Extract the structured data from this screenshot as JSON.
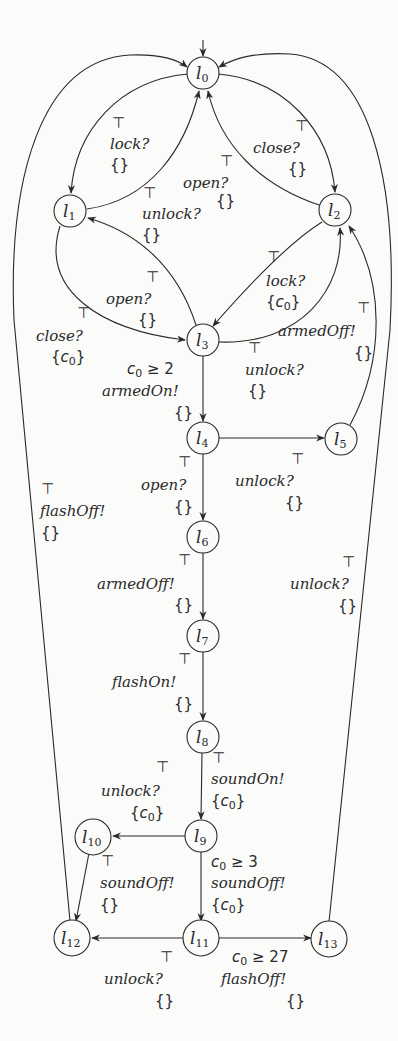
{
  "diagram": {
    "initial_location": "l0",
    "stroke_color": "#2a2a2a",
    "background_color": "#fbfbfa",
    "nodes": [
      {
        "id": "l0",
        "base": "l",
        "sub": "0",
        "x": 203,
        "y": 73
      },
      {
        "id": "l1",
        "base": "l",
        "sub": "1",
        "x": 70,
        "y": 211
      },
      {
        "id": "l2",
        "base": "l",
        "sub": "2",
        "x": 335,
        "y": 210
      },
      {
        "id": "l3",
        "base": "l",
        "sub": "3",
        "x": 203,
        "y": 340
      },
      {
        "id": "l4",
        "base": "l",
        "sub": "4",
        "x": 203,
        "y": 438
      },
      {
        "id": "l5",
        "base": "l",
        "sub": "5",
        "x": 341,
        "y": 439
      },
      {
        "id": "l6",
        "base": "l",
        "sub": "6",
        "x": 203,
        "y": 537
      },
      {
        "id": "l7",
        "base": "l",
        "sub": "7",
        "x": 203,
        "y": 636
      },
      {
        "id": "l8",
        "base": "l",
        "sub": "8",
        "x": 203,
        "y": 737
      },
      {
        "id": "l9",
        "base": "l",
        "sub": "9",
        "x": 201,
        "y": 836
      },
      {
        "id": "l10",
        "base": "l",
        "sub": "10",
        "x": 93,
        "y": 837
      },
      {
        "id": "l11",
        "base": "l",
        "sub": "11",
        "x": 201,
        "y": 938
      },
      {
        "id": "l12",
        "base": "l",
        "sub": "12",
        "x": 72,
        "y": 938
      },
      {
        "id": "l13",
        "base": "l",
        "sub": "13",
        "x": 329,
        "y": 939
      }
    ],
    "edges": [
      {
        "from": "l0",
        "to": "l1",
        "guard": "⊤",
        "action": "lock?",
        "reset": "{}",
        "label_x": 110,
        "label_y": 122
      },
      {
        "from": "l1",
        "to": "l0",
        "guard": "⊤",
        "action": "unlock?",
        "reset": "{}",
        "label_x": 142,
        "label_y": 195
      },
      {
        "from": "l0",
        "to": "l2",
        "guard": "⊤",
        "action": "close?",
        "reset": "{}",
        "label_x": 253,
        "label_y": 127
      },
      {
        "from": "l2",
        "to": "l0",
        "guard": "⊤",
        "action": "open?",
        "reset": "{}",
        "label_x": 183,
        "label_y": 160
      },
      {
        "from": "l1",
        "to": "l3",
        "guard": "⊤",
        "action": "close?",
        "reset": "{c0}",
        "label_x": 36,
        "label_y": 313
      },
      {
        "from": "l3",
        "to": "l1",
        "guard": "⊤",
        "action": "open?",
        "reset": "{}",
        "label_x": 106,
        "label_y": 277
      },
      {
        "from": "l2",
        "to": "l3",
        "guard": "⊤",
        "action": "lock?",
        "reset": "{c0}",
        "label_x": 266,
        "label_y": 255
      },
      {
        "from": "l3",
        "to": "l2",
        "guard": "⊤",
        "action": "unlock?",
        "reset": "{}",
        "label_x": 245,
        "label_y": 347
      },
      {
        "from": "l3",
        "to": "l4",
        "guard": "c0 ≥ 2",
        "action": "armedOn!",
        "reset": "{}",
        "label_x": 102,
        "label_y": 366
      },
      {
        "from": "l4",
        "to": "l5",
        "guard": "⊤",
        "action": "unlock?",
        "reset": "{}",
        "label_x": 235,
        "label_y": 458
      },
      {
        "from": "l5",
        "to": "l2",
        "guard": "⊤",
        "action": "armedOff!",
        "reset": "{}",
        "label_x": 278,
        "label_y": 306
      },
      {
        "from": "l4",
        "to": "l6",
        "guard": "⊤",
        "action": "open?",
        "reset": "{}",
        "label_x": 141,
        "label_y": 464
      },
      {
        "from": "l6",
        "to": "l7",
        "guard": "⊤",
        "action": "armedOff!",
        "reset": "{}",
        "label_x": 97,
        "label_y": 558
      },
      {
        "from": "l7",
        "to": "l8",
        "guard": "⊤",
        "action": "flashOn!",
        "reset": "{}",
        "label_x": 112,
        "label_y": 657
      },
      {
        "from": "l8",
        "to": "l9",
        "guard": "⊤",
        "action": "soundOn!",
        "reset": "{c0}",
        "label_x": 211,
        "label_y": 756
      },
      {
        "from": "l9",
        "to": "l10",
        "guard": "⊤",
        "action": "unlock?",
        "reset": "{c0}",
        "label_x": 101,
        "label_y": 763
      },
      {
        "from": "l10",
        "to": "l12",
        "guard": "⊤",
        "action": "soundOff!",
        "reset": "{}",
        "label_x": 100,
        "label_y": 856
      },
      {
        "from": "l9",
        "to": "l11",
        "guard": "c0 ≥ 3",
        "action": "soundOff!",
        "reset": "{c0}",
        "label_x": 211,
        "label_y": 858
      },
      {
        "from": "l11",
        "to": "l12",
        "guard": "⊤",
        "action": "unlock?",
        "reset": "{}",
        "label_x": 104,
        "label_y": 953
      },
      {
        "from": "l11",
        "to": "l13",
        "guard": "c0 ≥ 27",
        "action": "flashOff!",
        "reset": "{}",
        "label_x": 221,
        "label_y": 953
      },
      {
        "from": "l6",
        "to": "l0",
        "guard": "⊤",
        "action": "unlock?",
        "reset": "{}",
        "label_x": 290,
        "label_y": 561
      },
      {
        "from": "l12",
        "to": "l0",
        "guard": "⊤",
        "action": "flashOff!",
        "reset": "{}",
        "label_x": 40,
        "label_y": 488
      },
      {
        "from": "l13",
        "to": "l0",
        "guard": "",
        "action": "",
        "reset": "",
        "label_x": 0,
        "label_y": 0
      }
    ]
  },
  "labels": {
    "l0_l1": {
      "guard": "⊤",
      "action": "lock?",
      "reset": "{}"
    },
    "l1_l0": {
      "guard": "⊤",
      "action": "unlock?",
      "reset": "{}"
    },
    "l0_l2": {
      "guard": "⊤",
      "action": "close?",
      "reset": "{}"
    },
    "l2_l0": {
      "guard": "⊤",
      "action": "open?",
      "reset": "{}"
    },
    "l1_l3": {
      "guard": "⊤",
      "action": "close?",
      "reset_open": "{",
      "reset_var": "c",
      "reset_sub": "0",
      "reset_close": "}"
    },
    "l3_l1": {
      "guard": "⊤",
      "action": "open?",
      "reset": "{}"
    },
    "l2_l3": {
      "guard": "⊤",
      "action": "lock?",
      "reset_open": "{",
      "reset_var": "c",
      "reset_sub": "0",
      "reset_close": "}"
    },
    "l3_l2": {
      "guard": "⊤",
      "action": "unlock?",
      "reset": "{}"
    },
    "l3_l4": {
      "guard_var": "c",
      "guard_sub": "0",
      "guard_op": "≥ 2",
      "action": "armedOn!",
      "reset": "{}"
    },
    "l4_l5": {
      "guard": "⊤",
      "action": "unlock?",
      "reset": "{}"
    },
    "l5_l2": {
      "guard": "⊤",
      "action": "armedOff!",
      "reset": "{}"
    },
    "l4_l6": {
      "guard": "⊤",
      "action": "open?",
      "reset": "{}"
    },
    "l6_l7": {
      "guard": "⊤",
      "action": "armedOff!",
      "reset": "{}"
    },
    "l7_l8": {
      "guard": "⊤",
      "action": "flashOn!",
      "reset": "{}"
    },
    "l8_l9": {
      "guard": "⊤",
      "action": "soundOn!",
      "reset_open": "{",
      "reset_var": "c",
      "reset_sub": "0",
      "reset_close": "}"
    },
    "l9_l10": {
      "guard": "⊤",
      "action": "unlock?",
      "reset_open": "{",
      "reset_var": "c",
      "reset_sub": "0",
      "reset_close": "}"
    },
    "l10_l12": {
      "guard": "⊤",
      "action": "soundOff!",
      "reset": "{}"
    },
    "l9_l11": {
      "guard_var": "c",
      "guard_sub": "0",
      "guard_op": "≥ 3",
      "action": "soundOff!",
      "reset_open": "{",
      "reset_var": "c",
      "reset_sub": "0",
      "reset_close": "}"
    },
    "l11_l12": {
      "guard": "⊤",
      "action": "unlock?",
      "reset": "{}"
    },
    "l11_l13": {
      "guard_var": "c",
      "guard_sub": "0",
      "guard_op": "≥ 27",
      "action": "flashOff!",
      "reset": "{}"
    },
    "right_outer": {
      "guard": "⊤",
      "action": "unlock?",
      "reset": "{}"
    },
    "left_outer": {
      "guard": "⊤",
      "action": "flashOff!",
      "reset": "{}"
    }
  }
}
